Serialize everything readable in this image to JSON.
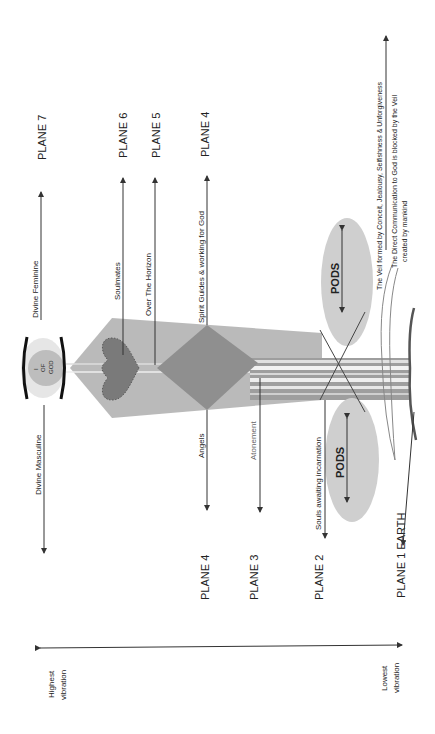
{
  "diagram": {
    "planes_upper": [
      {
        "id": "plane7",
        "label": "PLANE 7"
      },
      {
        "id": "plane6",
        "label": "PLANE 6"
      },
      {
        "id": "plane5",
        "label": "PLANE 5"
      },
      {
        "id": "plane4",
        "label": "PLANE 4"
      }
    ],
    "planes_lower": [
      {
        "id": "plane4",
        "label": "PLANE 4"
      },
      {
        "id": "plane3",
        "label": "PLANE 3"
      },
      {
        "id": "plane2",
        "label": "PLANE 2"
      },
      {
        "id": "plane1",
        "label": "PLANE 1  EARTH"
      }
    ],
    "center": {
      "god_label_line1": "I",
      "god_label_line2": "OF",
      "god_label_line3": "GOD"
    },
    "annotations": {
      "divine_feminine": "Divine Feminine",
      "divine_masculine": "Divine Masculine",
      "soulmates": "Soulmates",
      "over_the_horizon": "Over The Horizon",
      "spirit_guides": "Spirit Guides & working for God",
      "angels": "Angels",
      "atonement": "Atonement",
      "souls_awaiting": "Souls awaiting incarnation",
      "pods_upper": "PODS",
      "pods_lower": "PODS",
      "veil_formed": "The Veil formed by Conceit, Jealousy, Selfishness & Unforgiveness",
      "direct_comm_line1": "The Direct Communication to God is blocked by the Veil",
      "direct_comm_line2": "created by mankind"
    },
    "vibration_axis": {
      "highest_line1": "Highest",
      "highest_line2": "vibration",
      "lowest_line1": "Lowest",
      "lowest_line2": "vibration"
    },
    "colors": {
      "funnel": "#b3b3b3",
      "diamond": "#8f8f8f",
      "heart": "#7a7a7a",
      "pods": "#cfcfcf",
      "god_outer": "#e6e6e6",
      "god_inner": "#bdbdbd",
      "stroke": "#333333"
    }
  }
}
